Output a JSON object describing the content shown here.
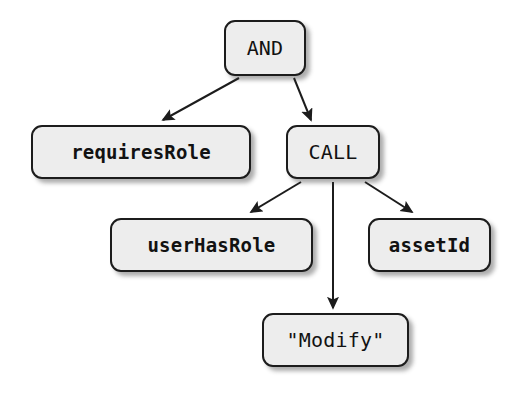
{
  "diagram": {
    "type": "abstract-syntax-tree",
    "background_color": "#ffffff",
    "node_fill": "#ededed",
    "node_border": "#1c1c1c",
    "edge_color": "#1c1c1c",
    "nodes": [
      {
        "id": "and",
        "label": "AND",
        "weight": "plain",
        "x": 224,
        "y": 20,
        "w": 82,
        "h": 56
      },
      {
        "id": "requiresRole",
        "label": "requiresRole",
        "weight": "bold",
        "x": 31,
        "y": 125,
        "w": 220,
        "h": 54
      },
      {
        "id": "call",
        "label": "CALL",
        "weight": "plain",
        "x": 286,
        "y": 125,
        "w": 94,
        "h": 54
      },
      {
        "id": "userHasRole",
        "label": "userHasRole",
        "weight": "bold",
        "x": 110,
        "y": 218,
        "w": 203,
        "h": 54
      },
      {
        "id": "assetId",
        "label": "assetId",
        "weight": "bold",
        "x": 368,
        "y": 218,
        "w": 123,
        "h": 54
      },
      {
        "id": "modify",
        "label": "\"Modify\"",
        "weight": "plain",
        "x": 262,
        "y": 313,
        "w": 147,
        "h": 54
      }
    ],
    "edges": [
      {
        "id": "and-requiresRole",
        "from": "and",
        "to": "requiresRole",
        "x1": 239,
        "y1": 78,
        "x2": 163,
        "y2": 120
      },
      {
        "id": "and-call",
        "from": "and",
        "to": "call",
        "x1": 294,
        "y1": 78,
        "x2": 311,
        "y2": 120
      },
      {
        "id": "call-userHasRole",
        "from": "call",
        "to": "userHasRole",
        "x1": 301,
        "y1": 182,
        "x2": 251,
        "y2": 212
      },
      {
        "id": "call-modify",
        "from": "call",
        "to": "modify",
        "x1": 333,
        "y1": 182,
        "x2": 333,
        "y2": 308
      },
      {
        "id": "call-assetId",
        "from": "call",
        "to": "assetId",
        "x1": 365,
        "y1": 182,
        "x2": 412,
        "y2": 212
      }
    ]
  }
}
